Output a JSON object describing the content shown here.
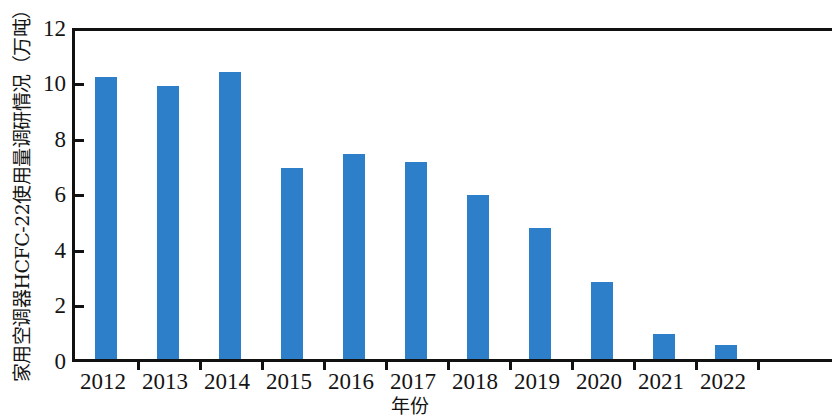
{
  "chart_data": {
    "type": "bar",
    "title": "",
    "xlabel": "年份",
    "ylabel": "家用空调器HCFC-22使用量调研情况（万吨）",
    "categories": [
      "2012",
      "2013",
      "2014",
      "2015",
      "2016",
      "2017",
      "2018",
      "2019",
      "2020",
      "2021",
      "2022"
    ],
    "values": [
      10.3,
      10.0,
      10.5,
      7.0,
      7.5,
      7.2,
      6.0,
      4.8,
      2.8,
      0.9,
      0.5
    ],
    "series": [
      {
        "name": "家用空调器HCFC-22使用量",
        "values": [
          10.3,
          10.0,
          10.5,
          7.0,
          7.5,
          7.2,
          6.0,
          4.8,
          2.8,
          0.9,
          0.5
        ]
      }
    ],
    "ylim": [
      0,
      12
    ],
    "y_ticks": [
      0,
      2,
      4,
      6,
      8,
      10,
      12
    ],
    "y_tick_labels": [
      "0",
      "2",
      "4",
      "6",
      "8",
      "10",
      "12"
    ],
    "grid": false,
    "legend": false,
    "legend_position": "none",
    "bar_color": "#2e7fc9",
    "axis_color": "#111111",
    "background_color": "#ffffff",
    "units": "万吨"
  }
}
